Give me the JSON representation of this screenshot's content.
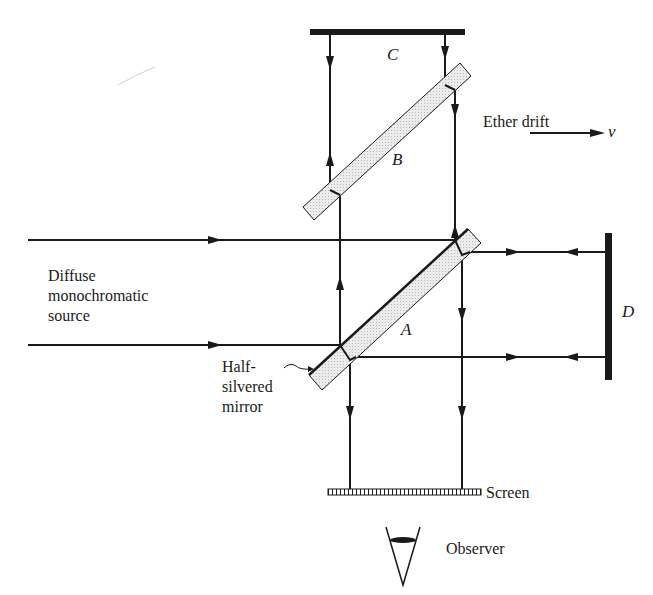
{
  "labels": {
    "mirror_c": "C",
    "mirror_b": "B",
    "mirror_a": "A",
    "mirror_d": "D",
    "ether_drift": "Ether drift",
    "velocity": "v",
    "source_line1": "Diffuse",
    "source_line2": "monochromatic",
    "source_line3": "source",
    "half_silvered_line1": "Half-",
    "half_silvered_line2": "silvered",
    "half_silvered_line3": "mirror",
    "screen": "Screen",
    "observer": "Observer"
  },
  "colors": {
    "ink": "#1a1a1a",
    "glass_fill": "#e6e6e6",
    "background": "#ffffff"
  }
}
